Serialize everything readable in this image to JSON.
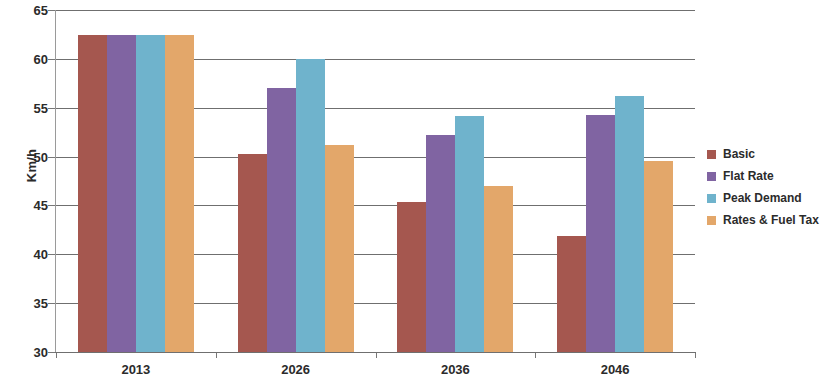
{
  "chart_data": {
    "type": "bar",
    "title": "",
    "subtitle": "",
    "xlabel": "",
    "ylabel": "Km/h",
    "categories": [
      "2013",
      "2026",
      "2036",
      "2046"
    ],
    "series": [
      {
        "name": "Basic",
        "color": "#a5574f",
        "values": [
          62.4,
          50.3,
          45.4,
          41.9
        ]
      },
      {
        "name": "Flat Rate",
        "color": "#8064a2",
        "values": [
          62.4,
          57.0,
          52.2,
          54.3
        ]
      },
      {
        "name": "Peak Demand",
        "color": "#6fb3cc",
        "values": [
          62.4,
          60.0,
          54.2,
          56.2
        ]
      },
      {
        "name": "Rates & Fuel Tax",
        "color": "#e3a76a",
        "values": [
          62.4,
          51.2,
          47.0,
          49.5
        ]
      }
    ],
    "ylim": [
      30,
      65
    ],
    "ytick_step": 5,
    "yticks": [
      30,
      35,
      40,
      45,
      50,
      55,
      60,
      65
    ],
    "ytick_labels": [
      "30",
      "35",
      "40",
      "45",
      "50",
      "55",
      "60",
      "65"
    ],
    "grid": true,
    "grid_axis": "y",
    "legend": true,
    "legend_position": "right",
    "legend_entries": [
      "Basic",
      "Flat Rate",
      "Peak Demand",
      "Rates & Fuel Tax"
    ],
    "bar_group_gap": true,
    "background_color": "#ffffff",
    "axis_color": "#6f6f6f",
    "text_color": "#2b2b2b"
  }
}
